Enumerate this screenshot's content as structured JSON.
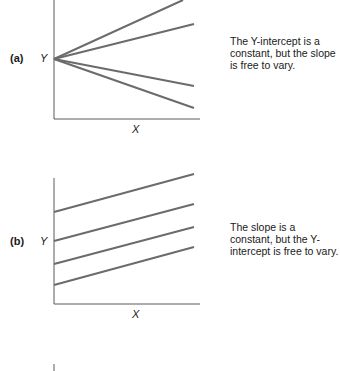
{
  "panels": [
    {
      "label": "(a)",
      "y_label": "Y",
      "x_label": "X",
      "caption": "The Y-intercept is a constant, but the slope is free to vary.",
      "lines": [
        {
          "x1": 54,
          "y1": 59,
          "x2": 183,
          "y2": 0
        },
        {
          "x1": 54,
          "y1": 59,
          "x2": 194,
          "y2": 24
        },
        {
          "x1": 54,
          "y1": 59,
          "x2": 194,
          "y2": 86
        },
        {
          "x1": 54,
          "y1": 59,
          "x2": 194,
          "y2": 108
        }
      ]
    },
    {
      "label": "(b)",
      "y_label": "Y",
      "x_label": "X",
      "caption": "The slope is a constant, but the Y-intercept is free to vary.",
      "lines": [
        {
          "x1": 54,
          "y1": 212,
          "x2": 194,
          "y2": 174
        },
        {
          "x1": 54,
          "y1": 241,
          "x2": 194,
          "y2": 204
        },
        {
          "x1": 54,
          "y1": 264,
          "x2": 194,
          "y2": 227
        },
        {
          "x1": 54,
          "y1": 285,
          "x2": 194,
          "y2": 247
        }
      ]
    }
  ],
  "colors": {
    "line": "#6b6b6b",
    "axis": "#5a5a5a",
    "text": "#1a1a1a"
  }
}
